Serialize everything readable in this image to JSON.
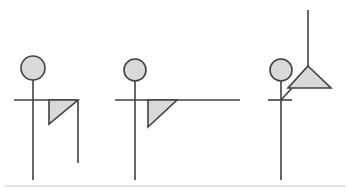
{
  "canvas": {
    "width": 349,
    "height": 193,
    "background_color": "#ffffff"
  },
  "style": {
    "stroke_color": "#404040",
    "fill_color": "#d9d9d9",
    "stroke_width": 1.6,
    "divider_color": "#c9c9c9"
  },
  "figures": [
    {
      "id": "figure-1",
      "name": "figure-one",
      "circle": {
        "cx": 33,
        "cy": 68,
        "r": 12
      },
      "stem": {
        "x1": 33,
        "y1": 80,
        "x2": 33,
        "y2": 180
      },
      "arm": {
        "x1": 14,
        "y1": 100,
        "x2": 78,
        "y2": 100
      },
      "triangle": {
        "points": "49,100 78,100 49,124"
      },
      "triangle_leg": {
        "x1": 78,
        "y1": 100,
        "x2": 78,
        "y2": 163
      }
    },
    {
      "id": "figure-2",
      "name": "figure-two",
      "circle": {
        "cx": 135,
        "cy": 70,
        "r": 11
      },
      "stem": {
        "x1": 135,
        "y1": 81,
        "x2": 135,
        "y2": 180
      },
      "arm": {
        "x1": 115,
        "y1": 100,
        "x2": 240,
        "y2": 100
      },
      "triangle": {
        "points": "148,100 177,100 148,127"
      },
      "triangle_leg": null
    },
    {
      "id": "figure-3",
      "name": "figure-three",
      "circle": {
        "cx": 281,
        "cy": 70,
        "r": 11
      },
      "stem": {
        "x1": 281,
        "y1": 81,
        "x2": 281,
        "y2": 180
      },
      "arm": {
        "x1": 268,
        "y1": 100,
        "x2": 292,
        "y2": 100
      },
      "triangle": {
        "points": "308,66 331,88 288,88"
      },
      "triangle_leg": {
        "x1": 308,
        "y1": 66,
        "x2": 308,
        "y2": 10
      },
      "connector": {
        "x1": 281,
        "y1": 100,
        "x2": 292,
        "y2": 88
      }
    }
  ],
  "divider": {
    "name": "bottom-divider",
    "x1": 4,
    "y1": 186,
    "x2": 345,
    "y2": 186
  }
}
